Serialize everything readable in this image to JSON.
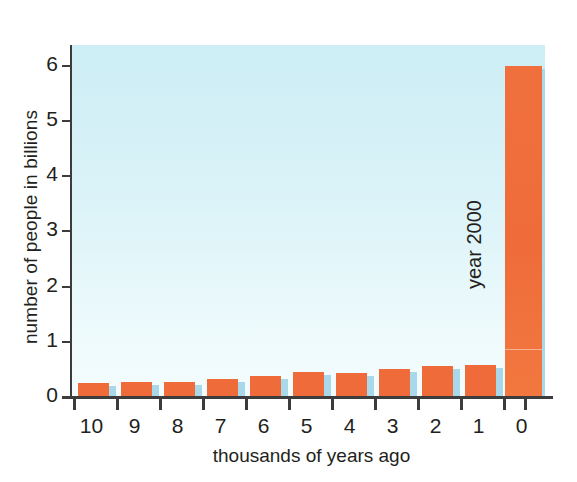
{
  "chart_data": {
    "type": "bar",
    "title": "",
    "xlabel": "thousands of years ago",
    "ylabel": "number of people in billions",
    "categories": [
      "10",
      "9",
      "8",
      "7",
      "6",
      "5",
      "4",
      "3",
      "2",
      "1",
      "0"
    ],
    "values": [
      0.25,
      0.28,
      0.28,
      0.32,
      0.38,
      0.45,
      0.43,
      0.5,
      0.57,
      0.58,
      6.0
    ],
    "ylim": [
      0,
      6.4
    ],
    "yticks": [
      0,
      1,
      2,
      3,
      4,
      5,
      6
    ],
    "ytick_labels": [
      "0",
      "1",
      "2",
      "3",
      "4",
      "5",
      "6"
    ],
    "grid": false,
    "legend": "none",
    "annotations": [
      {
        "text": "year 2000",
        "category": "0",
        "orientation": "vertical",
        "position": "left-of-last-bar"
      }
    ],
    "colors": {
      "bar": "#ef6c3a",
      "bar_shadow": "#a8d8ea",
      "plot_background_top": "#cdeef5",
      "plot_background_bottom": "#f4fcfd",
      "axis": "#3c3c3c",
      "text": "#231f20"
    }
  }
}
